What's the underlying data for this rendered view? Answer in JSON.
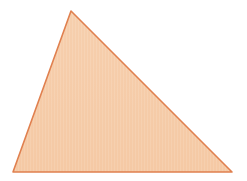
{
  "canvas": {
    "width": 247,
    "height": 181,
    "background_color": "#ffffff",
    "name": "figure-canvas"
  },
  "figure": {
    "shape": "triangle",
    "kind": "scalene-triangle",
    "label": "Triangle",
    "fill_color": "#F5CBA8",
    "fill_color_light": "#F9DCC4",
    "stroke_color": "#E0804F",
    "stroke_width": 1.6,
    "texture": "vertical-stripes",
    "texture_opacity": 0.35,
    "texture_spacing_px": 3,
    "vertices": [
      {
        "name": "apex",
        "x": 71,
        "y": 11
      },
      {
        "name": "bottom-right",
        "x": 232,
        "y": 172
      },
      {
        "name": "bottom-left",
        "x": 13,
        "y": 172
      }
    ],
    "points_attr": "71,11 232,172 13,172",
    "edges": [
      {
        "name": "left-edge",
        "from": "apex",
        "to": "bottom-left"
      },
      {
        "name": "hypotenuse",
        "from": "apex",
        "to": "bottom-right"
      },
      {
        "name": "base",
        "from": "bottom-left",
        "to": "bottom-right"
      }
    ]
  }
}
